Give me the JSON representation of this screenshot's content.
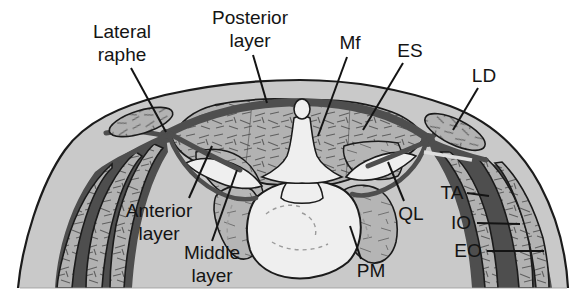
{
  "figure": {
    "kind": "anatomical-cross-section",
    "caption": ""
  },
  "colors": {
    "background": "#ffffff",
    "skin": "#c9c9c9",
    "muscle": "#b2b2b2",
    "fascia": "#4e4e4e",
    "bone": "#efefef",
    "outline": "#1b1b1b",
    "label_text": "#141414"
  },
  "labels": [
    {
      "id": "lateral-raphe",
      "lines": [
        "Lateral",
        "raphe"
      ],
      "x": 122,
      "y": 38,
      "lh": 23,
      "leader": [
        131,
        68,
        166,
        132
      ]
    },
    {
      "id": "posterior-layer",
      "lines": [
        "Posterior",
        "layer"
      ],
      "x": 250,
      "y": 24,
      "lh": 23,
      "leader": [
        253,
        55,
        267,
        103
      ]
    },
    {
      "id": "mf",
      "lines": [
        "Mf"
      ],
      "x": 350,
      "y": 49,
      "lh": 23,
      "leader": [
        347,
        57,
        318,
        136
      ]
    },
    {
      "id": "es",
      "lines": [
        "ES"
      ],
      "x": 410,
      "y": 57,
      "lh": 23,
      "leader": [
        403,
        63,
        363,
        130
      ]
    },
    {
      "id": "ld",
      "lines": [
        "LD"
      ],
      "x": 484,
      "y": 82,
      "lh": 23,
      "leader": [
        478,
        88,
        453,
        130
      ]
    },
    {
      "id": "ta",
      "lines": [
        "TA"
      ],
      "x": 452,
      "y": 199,
      "lh": 23,
      "leader": [
        467,
        193,
        489,
        196
      ]
    },
    {
      "id": "io",
      "lines": [
        "IO"
      ],
      "x": 461,
      "y": 229,
      "lh": 23,
      "leader": [
        477,
        223,
        520,
        224
      ]
    },
    {
      "id": "eo",
      "lines": [
        "EO"
      ],
      "x": 468,
      "y": 257,
      "lh": 23,
      "leader": [
        487,
        251,
        544,
        251
      ]
    },
    {
      "id": "ql",
      "lines": [
        "QL"
      ],
      "x": 411,
      "y": 220,
      "lh": 23,
      "leader": [
        404,
        201,
        388,
        162
      ]
    },
    {
      "id": "pm",
      "lines": [
        "PM"
      ],
      "x": 371,
      "y": 277,
      "lh": 23,
      "leader": [
        361,
        259,
        350,
        226
      ]
    },
    {
      "id": "anterior-layer",
      "lines": [
        "Anterior",
        "layer"
      ],
      "x": 159,
      "y": 217,
      "lh": 23,
      "leader": [
        189,
        198,
        212,
        146
      ]
    },
    {
      "id": "middle-layer",
      "lines": [
        "Middle",
        "layer"
      ],
      "x": 212,
      "y": 259,
      "lh": 23,
      "leader": [
        212,
        241,
        237,
        170
      ]
    }
  ]
}
